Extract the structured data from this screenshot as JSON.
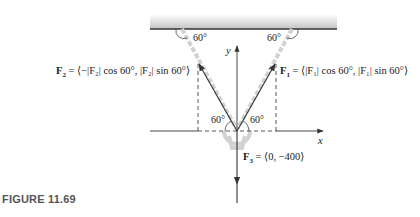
{
  "figure": {
    "caption": "FIGURE 11.69",
    "forces": {
      "f1": {
        "name": "F",
        "sub": "1",
        "expr": " = ⟨|F₁| cos 60°, |F₁| sin 60°⟩"
      },
      "f2": {
        "name": "F",
        "sub": "2",
        "expr": " = ⟨−|F₂| cos 60°, |F₂| sin 60°⟩"
      },
      "f3": {
        "name": "F",
        "sub": "3",
        "expr": " = ⟨0, −400⟩"
      }
    },
    "angles": {
      "top_left": "60°",
      "top_right": "60°",
      "bottom_left": "60°",
      "bottom_right": "60°"
    },
    "axes": {
      "x": "x",
      "y": "y"
    },
    "colors": {
      "ceiling_top": "#ffffff",
      "ceiling_bottom": "#c8c8c8",
      "ceiling_line": "#333333",
      "chain": "#d0d0d0",
      "vector": "#333333",
      "dashed": "#444444"
    }
  }
}
